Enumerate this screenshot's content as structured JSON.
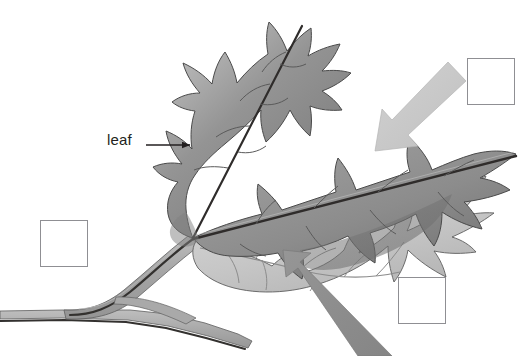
{
  "diagram": {
    "background_color": "#ffffff"
  },
  "labels": [
    {
      "id": "leaf",
      "text": "leaf",
      "pointer": "leader-line-with-arrowhead",
      "pointer_direction": "right",
      "text_color": "#231f20"
    }
  ],
  "answer_boxes": [
    {
      "id": "top-right",
      "value": "",
      "placeholder": "",
      "border_color": "#8f8f93",
      "fill_color": "#ffffff"
    },
    {
      "id": "left",
      "value": "",
      "placeholder": "",
      "border_color": "#8f8f93",
      "fill_color": "#ffffff"
    },
    {
      "id": "bottom-right",
      "value": "",
      "placeholder": "",
      "border_color": "#8f8f93",
      "fill_color": "#ffffff"
    }
  ],
  "callout_arrows": [
    {
      "id": "upper-right-arrow",
      "points_to": "leaf-margin-upper-right",
      "direction": "down-left",
      "fill_color": "#c9c9c9"
    },
    {
      "id": "lower-center-arrow",
      "points_to": "leaf-underside-lower-center",
      "direction": "up-left",
      "fill_color": "#8d8d8d"
    }
  ],
  "colors": {
    "leaf_blade_mid": "#8a8a8a",
    "leaf_blade_light": "#d8d8d8",
    "leaf_blade_dark": "#6e6e6e",
    "vein_dark": "#3a3a3a",
    "outline": "#4a4a4a",
    "stem_gray": "#a8a8a8",
    "arrow_light": "#c9c9c9",
    "arrow_mid": "#8d8d8d",
    "box_border": "#8f8f93",
    "text": "#231f20"
  }
}
